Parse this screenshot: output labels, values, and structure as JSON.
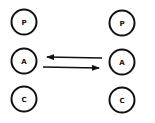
{
  "diagram": {
    "type": "transactional-analysis",
    "left_person": {
      "states": [
        {
          "label": "P",
          "cx": 24,
          "cy": 22
        },
        {
          "label": "A",
          "cx": 24,
          "cy": 61
        },
        {
          "label": "C",
          "cx": 24,
          "cy": 99
        }
      ]
    },
    "right_person": {
      "states": [
        {
          "label": "P",
          "cx": 122,
          "cy": 23
        },
        {
          "label": "A",
          "cx": 122,
          "cy": 62
        },
        {
          "label": "C",
          "cx": 122,
          "cy": 100
        }
      ]
    },
    "arrows": [
      {
        "from": "right.A",
        "to": "left.A",
        "x1": 102,
        "y1": 58,
        "x2": 47,
        "y2": 57
      },
      {
        "from": "left.A",
        "to": "right.A",
        "x1": 43,
        "y1": 67,
        "x2": 99,
        "y2": 68
      }
    ],
    "circle_radius": 12.5,
    "stroke_color": "#111111"
  }
}
